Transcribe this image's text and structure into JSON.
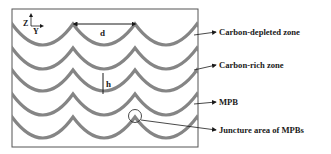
{
  "diagram": {
    "axes": {
      "z_label": "Z",
      "y_label": "Y"
    },
    "dimensions": {
      "width_label": "d",
      "height_label": "h"
    },
    "labels": [
      {
        "id": "carbon-depleted",
        "text": "Carbon-depleted zone"
      },
      {
        "id": "carbon-rich",
        "text": "Carbon-rich zone"
      },
      {
        "id": "mpb",
        "text": "MPB"
      },
      {
        "id": "juncture",
        "text": "Juncture area of MPBs"
      }
    ],
    "colors": {
      "boundary": "#858585",
      "frame": "#555555",
      "text": "#1a1a1a"
    }
  }
}
